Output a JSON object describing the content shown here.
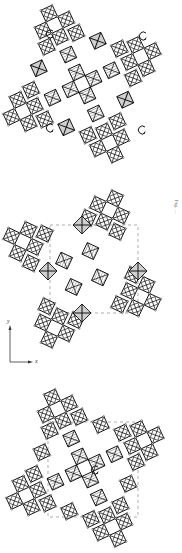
{
  "figure": {
    "panels": [
      {
        "id": "top",
        "rotation_markers": 4,
        "description": "octahedral framework with four rotation arrows"
      },
      {
        "id": "middle",
        "rotation_markers": 0,
        "description": "octahedral framework with dashed unit cell"
      },
      {
        "id": "bottom",
        "rotation_markers": 1,
        "description": "octahedral framework with one rotation arrow and dashed unit cell"
      }
    ],
    "axes": {
      "y_label": "y",
      "x_label": "x"
    },
    "caption_text": "Fig. ...",
    "colors": {
      "line": "#111111",
      "shade": "#cfcfcf",
      "hatch": "#555555",
      "dashed": "#777777"
    }
  }
}
